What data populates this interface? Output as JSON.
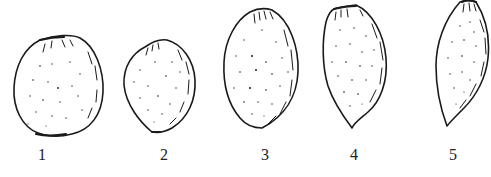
{
  "figure": {
    "type": "line-drawing",
    "stroke_color": "#1a1a1a",
    "background": "#ffffff",
    "items": [
      {
        "label": "1",
        "shape": "round",
        "label_x": 42
      },
      {
        "label": "2",
        "shape": "ovate",
        "label_x": 164
      },
      {
        "label": "3",
        "shape": "elliptic",
        "label_x": 265
      },
      {
        "label": "4",
        "shape": "oblong-pointed",
        "label_x": 354
      },
      {
        "label": "5",
        "shape": "narrow-lanceolate",
        "label_x": 453
      }
    ]
  }
}
